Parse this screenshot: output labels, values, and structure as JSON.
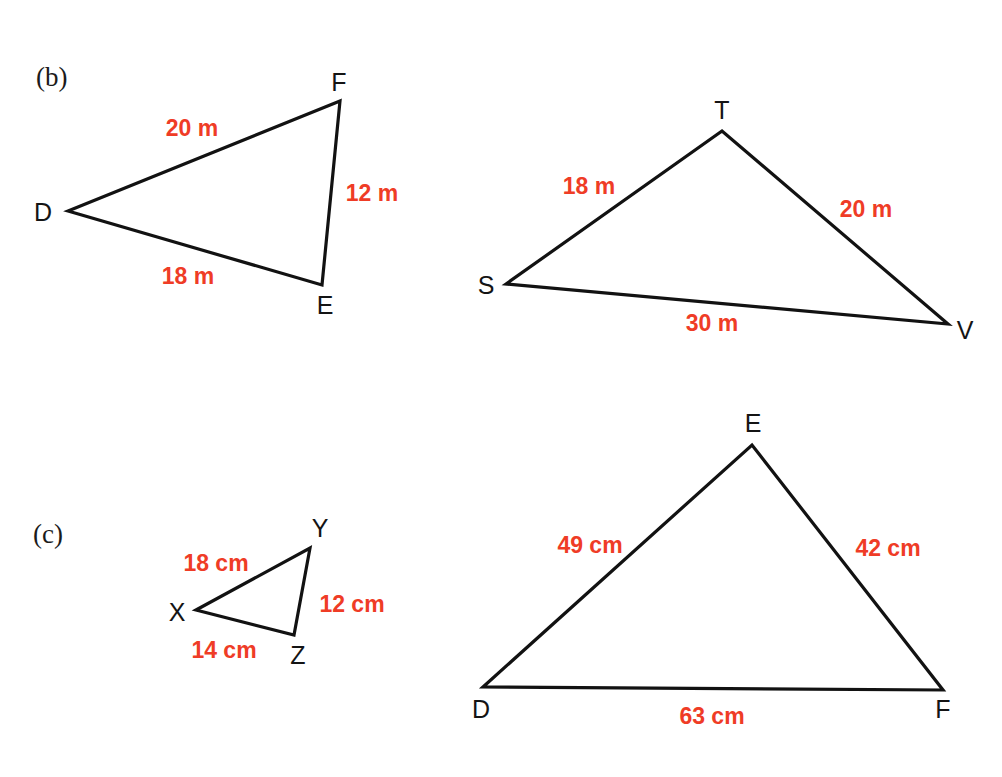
{
  "page": {
    "background_color": "#ffffff",
    "ink_color": "#121212",
    "measure_color": "#ef3c26",
    "width": 1002,
    "height": 777
  },
  "parts": [
    {
      "id": "part-b",
      "label": "(b)",
      "x": 36,
      "y": 64
    },
    {
      "id": "part-c",
      "label": "(c)",
      "x": 33,
      "y": 521
    }
  ],
  "figures": [
    {
      "id": "triangle-def-top",
      "part": "(b)",
      "name": "DEF",
      "units": "m",
      "stroke_width": 3.2,
      "vertices": [
        {
          "name": "D",
          "x": 68,
          "y": 211,
          "label_x": 43,
          "label_y": 212
        },
        {
          "name": "E",
          "x": 322,
          "y": 285,
          "label_x": 325,
          "label_y": 305
        },
        {
          "name": "F",
          "x": 340,
          "y": 101,
          "label_x": 339,
          "label_y": 82
        }
      ],
      "sides": [
        {
          "from": "D",
          "to": "F",
          "length": "20 m",
          "label_x": 192,
          "label_y": 128
        },
        {
          "from": "F",
          "to": "E",
          "length": "12 m",
          "label_x": 372,
          "label_y": 193
        },
        {
          "from": "D",
          "to": "E",
          "length": "18 m",
          "label_x": 188,
          "label_y": 276
        }
      ]
    },
    {
      "id": "triangle-stv-top",
      "part": "(b)",
      "name": "STV",
      "units": "m",
      "stroke_width": 3.2,
      "vertices": [
        {
          "name": "S",
          "x": 506,
          "y": 284,
          "label_x": 486,
          "label_y": 285
        },
        {
          "name": "T",
          "x": 722,
          "y": 131,
          "label_x": 722,
          "label_y": 110
        },
        {
          "name": "V",
          "x": 948,
          "y": 324,
          "label_x": 965,
          "label_y": 330
        }
      ],
      "sides": [
        {
          "from": "S",
          "to": "T",
          "length": "18 m",
          "label_x": 589,
          "label_y": 186
        },
        {
          "from": "T",
          "to": "V",
          "length": "20 m",
          "label_x": 866,
          "label_y": 209
        },
        {
          "from": "S",
          "to": "V",
          "length": "30 m",
          "label_x": 712,
          "label_y": 323
        }
      ]
    },
    {
      "id": "triangle-xyz-bottom",
      "part": "(c)",
      "name": "XYZ",
      "units": "cm",
      "stroke_width": 3.2,
      "vertices": [
        {
          "name": "X",
          "x": 196,
          "y": 610,
          "label_x": 177,
          "label_y": 612
        },
        {
          "name": "Y",
          "x": 310,
          "y": 548,
          "label_x": 320,
          "label_y": 528
        },
        {
          "name": "Z",
          "x": 294,
          "y": 635,
          "label_x": 298,
          "label_y": 655
        }
      ],
      "sides": [
        {
          "from": "X",
          "to": "Y",
          "length": "18 cm",
          "label_x": 216,
          "label_y": 563
        },
        {
          "from": "Y",
          "to": "Z",
          "length": "12 cm",
          "label_x": 352,
          "label_y": 604
        },
        {
          "from": "X",
          "to": "Z",
          "length": "14 cm",
          "label_x": 224,
          "label_y": 650
        }
      ]
    },
    {
      "id": "triangle-def-bottom",
      "part": "(c)",
      "name": "DEF",
      "units": "cm",
      "stroke_width": 3.2,
      "vertices": [
        {
          "name": "D",
          "x": 483,
          "y": 687,
          "label_x": 481,
          "label_y": 709
        },
        {
          "name": "E",
          "x": 752,
          "y": 445,
          "label_x": 753,
          "label_y": 423
        },
        {
          "name": "F",
          "x": 943,
          "y": 690,
          "label_x": 943,
          "label_y": 709
        }
      ],
      "sides": [
        {
          "from": "D",
          "to": "E",
          "length": "49 cm",
          "label_x": 590,
          "label_y": 545
        },
        {
          "from": "E",
          "to": "F",
          "length": "42 cm",
          "label_x": 888,
          "label_y": 548
        },
        {
          "from": "D",
          "to": "F",
          "length": "63 cm",
          "label_x": 712,
          "label_y": 716
        }
      ]
    }
  ]
}
